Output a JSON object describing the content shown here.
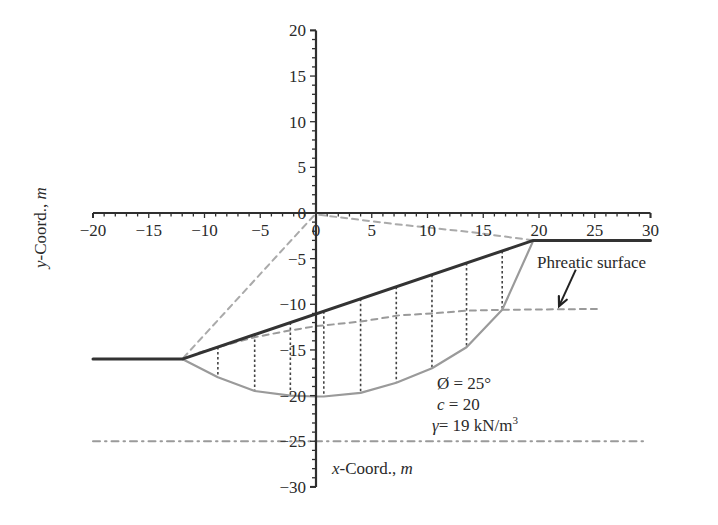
{
  "chart_data": {
    "type": "line",
    "title": "",
    "xlabel": "x-Coord., m",
    "ylabel": "y-Coord., m",
    "xlim": [
      -20,
      30
    ],
    "ylim": [
      -30,
      20
    ],
    "x_ticks": [
      -20,
      -15,
      -10,
      -5,
      0,
      5,
      10,
      15,
      20,
      25,
      30
    ],
    "y_ticks": [
      20,
      15,
      10,
      5,
      0,
      -5,
      -10,
      -15,
      -20,
      -25,
      -30
    ],
    "grid": false,
    "legend": null,
    "series": [
      {
        "name": "Ground surface",
        "style": "solid",
        "color": "#333333",
        "points": [
          [
            -20,
            -16
          ],
          [
            -12,
            -16
          ],
          [
            19.5,
            -3
          ],
          [
            30,
            -3
          ]
        ]
      },
      {
        "name": "Slip surface",
        "style": "solid",
        "color": "#9a9a9a",
        "points": [
          [
            -12,
            -16
          ],
          [
            -8.8,
            -18
          ],
          [
            -5.5,
            -19.5
          ],
          [
            -2.3,
            -20
          ],
          [
            0,
            -20.1
          ],
          [
            0.7,
            -20.1
          ],
          [
            4,
            -19.7
          ],
          [
            7.2,
            -18.6
          ],
          [
            10.4,
            -17
          ],
          [
            13.5,
            -14.7
          ],
          [
            16.7,
            -10.6
          ],
          [
            19.5,
            -3
          ]
        ]
      },
      {
        "name": "Phreatic surface",
        "style": "dashed",
        "color": "#9a9a9a",
        "points": [
          [
            -10.5,
            -15.3
          ],
          [
            -8.5,
            -14.6
          ],
          [
            -5.5,
            -13.6
          ],
          [
            -2.5,
            -12.9
          ],
          [
            0,
            -12.4
          ],
          [
            4,
            -11.9
          ],
          [
            7.5,
            -11.2
          ],
          [
            10.5,
            -11
          ],
          [
            13.5,
            -10.7
          ],
          [
            16.7,
            -10.6
          ],
          [
            25.5,
            -10.5
          ]
        ]
      },
      {
        "name": "Radius to toe",
        "style": "dashed",
        "color": "#aaaaaa",
        "points": [
          [
            -0.2,
            -0.3
          ],
          [
            -12,
            -16
          ]
        ]
      },
      {
        "name": "Radius to crest",
        "style": "dashed",
        "color": "#aaaaaa",
        "points": [
          [
            0.3,
            -0.2
          ],
          [
            7,
            -1.2
          ],
          [
            14,
            -2.1
          ],
          [
            19.5,
            -3
          ]
        ]
      },
      {
        "name": "Bedrock / firm layer",
        "style": "dashdot",
        "color": "#9a9a9a",
        "points": [
          [
            -20,
            -25
          ],
          [
            29.7,
            -25
          ]
        ]
      }
    ],
    "slices": {
      "x": [
        -8.8,
        -5.5,
        -2.3,
        0.7,
        4,
        7.2,
        10.4,
        13.5,
        16.7
      ],
      "style": "dotted",
      "color": "#444444"
    },
    "annotations": [
      {
        "text": "Phreatic surface",
        "x": 19.8,
        "y": -5.6,
        "arrow_from": [
          23.3,
          -6.2
        ],
        "arrow_to": [
          21.8,
          -10.2
        ]
      },
      {
        "text": "Ø = 25°",
        "x": 10.8,
        "y": -19.1
      },
      {
        "text": "c = 20",
        "x": 10.8,
        "y": -21.4
      },
      {
        "text": "γ = 19 kN/m³",
        "x": 10.8,
        "y": -23.6
      }
    ],
    "soil_parameters": {
      "friction_angle": "Ø = 25°",
      "cohesion": "c = 20",
      "unit_weight": "γ = 19 kN/m³"
    }
  },
  "labels": {
    "x_axis_title_prefix": "x",
    "x_axis_title_mid": "-Coord., ",
    "x_axis_title_unit": "m",
    "y_axis_title_prefix": "y",
    "y_axis_title_mid": "-Coord., ",
    "y_axis_title_unit": "m",
    "phreatic_label": "Phreatic surface",
    "phi_label": "Ø = 25°",
    "c_prefix": "c",
    "c_rest": " = 20",
    "gamma_prefix": "γ",
    "gamma_rest": "= 19 kN/m",
    "gamma_sup": "3"
  }
}
